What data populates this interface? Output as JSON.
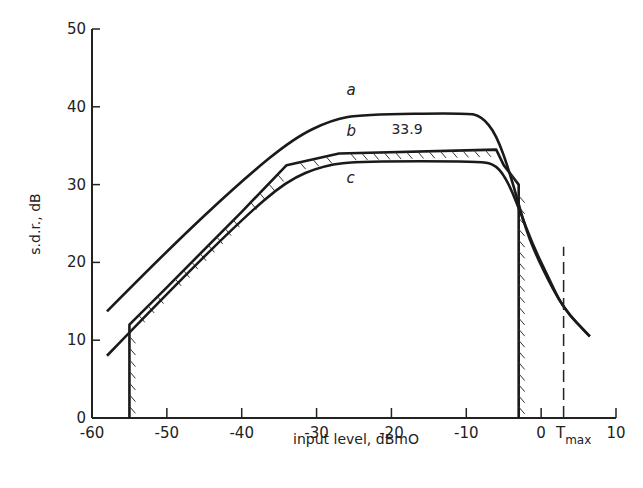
{
  "chart_data": {
    "type": "line",
    "title": "",
    "xlabel": "input level, dBmO",
    "ylabel": "s.d.r., dB",
    "xlim": [
      -60,
      10
    ],
    "ylim": [
      0,
      50
    ],
    "x_ticks": [
      -60,
      -50,
      -40,
      -30,
      -20,
      -10,
      0,
      10
    ],
    "x_tick_labels": [
      "-60",
      "-50",
      "-40",
      "-30",
      "-20",
      "-10",
      "0",
      "10"
    ],
    "y_ticks": [
      0,
      10,
      20,
      30,
      40,
      50
    ],
    "y_tick_labels": [
      "0",
      "10",
      "20",
      "30",
      "40",
      "50"
    ],
    "grid": false,
    "legend": null,
    "series": [
      {
        "name": "a",
        "style": "solid",
        "points": [
          [
            -58,
            13.7
          ],
          [
            -50,
            21.5
          ],
          [
            -40,
            30.5
          ],
          [
            -33,
            36.0
          ],
          [
            -28,
            38.3
          ],
          [
            -24,
            39.0
          ],
          [
            -10,
            39.2
          ],
          [
            -8,
            38.8
          ],
          [
            -6,
            36.5
          ],
          [
            -4,
            31.0
          ],
          [
            -2,
            24.0
          ],
          [
            0,
            19.5
          ],
          [
            3,
            14.0
          ],
          [
            6.5,
            10.5
          ]
        ]
      },
      {
        "name": "b",
        "style": "hatched mask",
        "points": [
          [
            -55,
            0
          ],
          [
            -55,
            12.0
          ],
          [
            -50,
            16.8
          ],
          [
            -40,
            26.5
          ],
          [
            -34,
            32.5
          ],
          [
            -27,
            34.0
          ],
          [
            -6,
            34.5
          ],
          [
            -5,
            32.5
          ],
          [
            -3,
            30.0
          ],
          [
            -3,
            0
          ]
        ]
      },
      {
        "name": "c",
        "style": "solid",
        "points": [
          [
            -58,
            8.0
          ],
          [
            -50,
            16.0
          ],
          [
            -40,
            25.5
          ],
          [
            -34,
            30.5
          ],
          [
            -29,
            32.5
          ],
          [
            -24,
            33.0
          ],
          [
            -8,
            33.0
          ],
          [
            -6,
            32.5
          ],
          [
            -4.5,
            30.5
          ],
          [
            -3,
            27.0
          ],
          [
            -1,
            22.0
          ],
          [
            1,
            18.0
          ],
          [
            3,
            14.0
          ],
          [
            6.5,
            10.5
          ]
        ]
      }
    ],
    "annotations": [
      {
        "text": "33.9",
        "x": -20,
        "y": 36.5
      },
      {
        "text": "a",
        "x": -26,
        "y": 41.5
      },
      {
        "text": "b",
        "x": -26,
        "y": 36.3
      },
      {
        "text": "c",
        "x": -26,
        "y": 30.2
      }
    ],
    "reference_lines": [
      {
        "name": "Tmax",
        "orientation": "vertical",
        "x": 3,
        "y_range": [
          0,
          22
        ],
        "style": "dashed"
      }
    ]
  },
  "labels": {
    "xlabel": "input level, dBmO",
    "ylabel": "s.d.r., dB",
    "tmax_T": "T",
    "tmax_sub": "max",
    "annot_339": "33.9",
    "curve_a": "a",
    "curve_b": "b",
    "curve_c": "c"
  }
}
